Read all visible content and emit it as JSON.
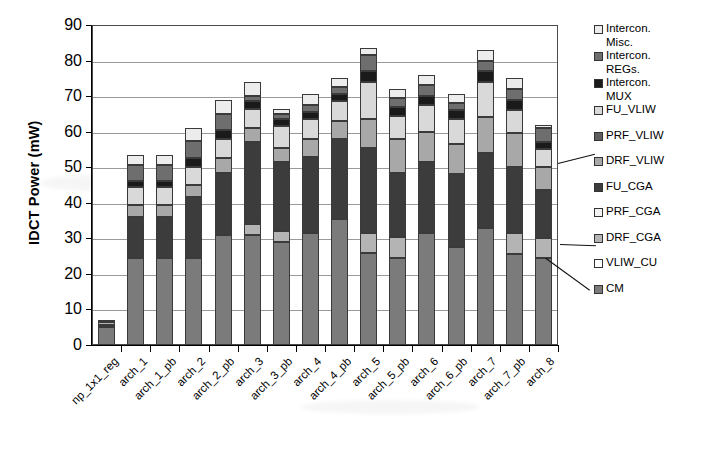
{
  "chart_data": {
    "type": "bar",
    "subtype": "stacked-bar",
    "title": "",
    "xlabel": "",
    "ylabel": "IDCT Power (mW)",
    "ylim": [
      0,
      90
    ],
    "ytick_step": 10,
    "yticks": [
      90,
      80,
      70,
      60,
      50,
      40,
      30,
      20,
      10,
      0
    ],
    "grid": true,
    "legend_position": "right",
    "categories": [
      "np_1x1_reg",
      "arch_1",
      "arch_1_pb",
      "arch_2",
      "arch_2_pb",
      "arch_3",
      "arch_3_pb",
      "arch_4",
      "arch_4_pb",
      "arch_5",
      "arch_5_pb",
      "arch_6",
      "arch_6_pb",
      "arch_7",
      "arch_7_pb",
      "arch_8"
    ],
    "series": [
      {
        "name": "CM",
        "color": "#7b7b7b",
        "values": [
          5.0,
          24.5,
          24.5,
          24.5,
          31.0,
          31.0,
          29.0,
          31.5,
          35.5,
          26.0,
          24.5,
          31.5,
          27.5,
          33.0,
          25.5,
          24.5
        ]
      },
      {
        "name": "VLIW_CU",
        "color": "#ffffff",
        "values": [
          0.6,
          0.0,
          0.0,
          0.0,
          0.0,
          0.0,
          0.0,
          0.0,
          0.0,
          0.0,
          0.0,
          0.0,
          0.0,
          0.0,
          0.0,
          0.0
        ]
      },
      {
        "name": "DRF_CGA",
        "color": "#b4b4b4",
        "values": [
          0.9,
          0.0,
          0.0,
          0.0,
          0.0,
          3.0,
          3.0,
          0.0,
          0.0,
          5.5,
          6.0,
          0.0,
          0.0,
          0.0,
          6.0,
          5.5
        ]
      },
      {
        "name": "PRF_CGA",
        "color": "#f2f2f2",
        "values": [
          0.0,
          0.0,
          0.0,
          0.0,
          0.0,
          0.0,
          0.0,
          0.0,
          0.0,
          0.0,
          0.0,
          0.0,
          0.0,
          0.0,
          0.0,
          0.0
        ]
      },
      {
        "name": "FU_CGA",
        "color": "#3c3c3c",
        "values": [
          0.0,
          11.5,
          11.5,
          17.0,
          17.5,
          23.0,
          19.5,
          21.5,
          22.5,
          24.0,
          18.0,
          20.0,
          20.5,
          21.0,
          18.5,
          13.5
        ]
      },
      {
        "name": "DRF_VLIW",
        "color": "#a8a8a8",
        "values": [
          0.0,
          3.5,
          3.5,
          3.5,
          4.0,
          4.0,
          4.0,
          5.0,
          5.0,
          8.0,
          9.5,
          8.5,
          8.5,
          10.0,
          9.5,
          6.5
        ]
      },
      {
        "name": "PRF_VLIW",
        "color": "#5e5e5e",
        "values": [
          0.0,
          0.0,
          0.0,
          0.0,
          0.0,
          0.0,
          0.0,
          0.0,
          0.0,
          0.0,
          0.0,
          0.0,
          0.0,
          0.0,
          0.0,
          0.0
        ]
      },
      {
        "name": "FU_VLIW",
        "color": "#d9d9d9",
        "values": [
          0.0,
          5.0,
          5.0,
          5.0,
          5.5,
          5.5,
          6.0,
          5.5,
          5.5,
          10.5,
          6.5,
          7.5,
          7.0,
          10.0,
          6.5,
          5.0
        ]
      },
      {
        "name": "Intercon. MUX",
        "color": "#1a1a1a",
        "values": [
          0.0,
          1.5,
          1.5,
          2.5,
          2.5,
          2.0,
          2.0,
          2.0,
          2.0,
          3.0,
          2.5,
          2.5,
          2.5,
          3.0,
          3.0,
          2.0
        ]
      },
      {
        "name": "Intercon. REGs.",
        "color": "#6e6e6e",
        "values": [
          0.0,
          4.5,
          4.5,
          5.0,
          4.5,
          1.5,
          1.5,
          2.0,
          2.0,
          4.5,
          2.5,
          3.0,
          2.0,
          3.0,
          3.0,
          4.0
        ]
      },
      {
        "name": "Intercon. Misc.",
        "color": "#ececec",
        "values": [
          0.5,
          3.0,
          3.0,
          3.5,
          4.0,
          4.0,
          1.5,
          3.0,
          2.5,
          2.0,
          2.5,
          3.0,
          2.5,
          3.0,
          3.0,
          1.0
        ]
      }
    ],
    "totals": [
      7.0,
      53.5,
      53.5,
      61.0,
      69.0,
      74.0,
      66.5,
      70.5,
      75.0,
      83.5,
      72.0,
      76.0,
      70.5,
      83.0,
      75.0,
      62.0
    ]
  },
  "legend": {
    "items": [
      {
        "label": "Intercon.\nMisc.",
        "color": "#ececec"
      },
      {
        "label": "Intercon.\nREGs.",
        "color": "#6e6e6e"
      },
      {
        "label": "Intercon.\nMUX",
        "color": "#1a1a1a"
      },
      {
        "label": "FU_VLIW",
        "color": "#d9d9d9"
      },
      {
        "label": "PRF_VLIW",
        "color": "#5e5e5e"
      },
      {
        "label": "DRF_VLIW",
        "color": "#a8a8a8"
      },
      {
        "label": "FU_CGA",
        "color": "#3c3c3c"
      },
      {
        "label": "PRF_CGA",
        "color": "#f2f2f2"
      },
      {
        "label": "DRF_CGA",
        "color": "#b4b4b4"
      },
      {
        "label": "VLIW_CU",
        "color": "#ffffff"
      },
      {
        "label": "CM",
        "color": "#7b7b7b"
      }
    ]
  }
}
